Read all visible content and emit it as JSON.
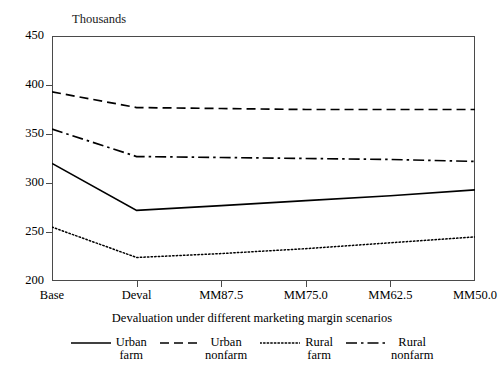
{
  "chart_data": {
    "type": "line",
    "title": "",
    "unit_label": "Thousands",
    "xlabel": "Devaluation under different marketing margin scenarios",
    "ylabel": "",
    "categories": [
      "Base",
      "Deval",
      "MM87.5",
      "MM75.0",
      "MM62.5",
      "MM50.0"
    ],
    "ylim": [
      200,
      450
    ],
    "yticks": [
      200,
      250,
      300,
      350,
      400,
      450
    ],
    "grid": false,
    "legend_position": "bottom",
    "series": [
      {
        "name": "Urban farm",
        "name_line1": "Urban",
        "name_line2": "farm",
        "style": "solid",
        "color": "#000000",
        "values": [
          320,
          272,
          277,
          282,
          287,
          293
        ]
      },
      {
        "name": "Urban nonfarm",
        "name_line1": "Urban",
        "name_line2": "nonfarm",
        "style": "dashed",
        "color": "#000000",
        "values": [
          393,
          377,
          376,
          375,
          375,
          375
        ]
      },
      {
        "name": "Rural farm",
        "name_line1": "Rural",
        "name_line2": "farm",
        "style": "dotted",
        "color": "#000000",
        "values": [
          255,
          224,
          228,
          233,
          239,
          245
        ]
      },
      {
        "name": "Rural nonfarm",
        "name_line1": "Rural",
        "name_line2": "nonfarm",
        "style": "dashdot",
        "color": "#000000",
        "values": [
          355,
          327,
          326,
          325,
          324,
          322
        ]
      }
    ]
  },
  "axis": {
    "ytick_labels": [
      "450",
      "400",
      "350",
      "300",
      "250",
      "200"
    ]
  }
}
